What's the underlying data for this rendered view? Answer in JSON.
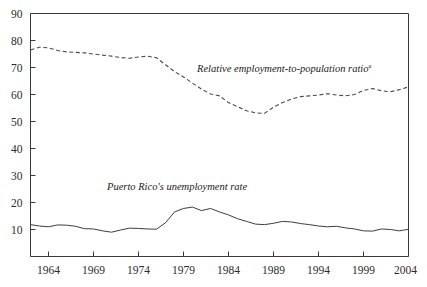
{
  "chart_data": {
    "type": "line",
    "title": "",
    "xlabel": "",
    "ylabel": "",
    "xlim": [
      1962,
      2004
    ],
    "ylim": [
      0,
      90
    ],
    "grid": false,
    "legend_position": "inline-annotations",
    "y_ticks": [
      10,
      20,
      30,
      40,
      50,
      60,
      70,
      80,
      90
    ],
    "x_ticks": [
      1964,
      1969,
      1974,
      1979,
      1984,
      1989,
      1994,
      1999,
      2004
    ],
    "annotations": [
      {
        "text": "Relative employment-to-population ratio",
        "superscript": "a",
        "series": "relative_employment_to_population_ratio",
        "x": 1980.5,
        "y": 68.5
      },
      {
        "text": "Puerto Rico's unemployment rate",
        "superscript": "",
        "series": "puerto_ricos_unemployment_rate",
        "x": 1970.5,
        "y": 24.5
      }
    ],
    "series": [
      {
        "name": "Relative employment-to-population ratio",
        "style": "dashed",
        "x": [
          1962,
          1963,
          1964,
          1965,
          1966,
          1967,
          1968,
          1969,
          1970,
          1971,
          1972,
          1973,
          1974,
          1975,
          1976,
          1977,
          1978,
          1979,
          1980,
          1981,
          1982,
          1983,
          1984,
          1985,
          1986,
          1987,
          1988,
          1989,
          1990,
          1991,
          1992,
          1993,
          1994,
          1995,
          1996,
          1997,
          1998,
          1999,
          2000,
          2001,
          2002,
          2003,
          2004
        ],
        "values": [
          76.5,
          77.5,
          77.3,
          76.3,
          75.8,
          75.6,
          75.4,
          75.0,
          74.6,
          74.2,
          73.7,
          73.4,
          73.9,
          74.2,
          73.6,
          71.0,
          68.5,
          66.5,
          64.2,
          62.0,
          60.2,
          59.5,
          57.0,
          55.5,
          54.0,
          53.2,
          53.0,
          55.3,
          57.0,
          58.3,
          59.2,
          59.5,
          59.8,
          60.3,
          59.8,
          59.5,
          60.0,
          61.5,
          62.2,
          61.4,
          61.0,
          61.8,
          62.8
        ]
      },
      {
        "name": "Puerto Rico's unemployment rate",
        "style": "solid",
        "x": [
          1962,
          1963,
          1964,
          1965,
          1966,
          1967,
          1968,
          1969,
          1970,
          1971,
          1972,
          1973,
          1974,
          1975,
          1976,
          1977,
          1978,
          1979,
          1980,
          1981,
          1982,
          1983,
          1984,
          1985,
          1986,
          1987,
          1988,
          1989,
          1990,
          1991,
          1992,
          1993,
          1994,
          1995,
          1996,
          1997,
          1998,
          1999,
          2000,
          2001,
          2002,
          2003,
          2004
        ],
        "values": [
          11.8,
          11.3,
          11.0,
          11.7,
          11.6,
          11.2,
          10.3,
          10.2,
          9.5,
          9.0,
          9.8,
          10.5,
          10.4,
          10.2,
          10.1,
          12.5,
          16.5,
          17.8,
          18.3,
          17.0,
          17.8,
          16.5,
          15.4,
          14.0,
          13.0,
          12.0,
          11.8,
          12.3,
          13.0,
          12.8,
          12.2,
          11.8,
          11.3,
          11.0,
          11.2,
          10.6,
          10.2,
          9.5,
          9.4,
          10.2,
          10.0,
          9.5,
          10.1
        ]
      }
    ]
  }
}
